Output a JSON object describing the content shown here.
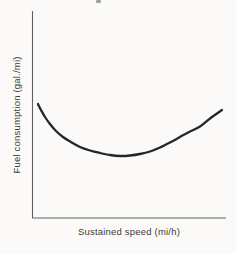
{
  "chart_data": {
    "type": "line",
    "title": "",
    "xlabel": "Sustained speed (mi/h)",
    "ylabel": "Fuel consumption (gal./mi)",
    "x_ticks": [],
    "y_ticks": [],
    "grid": false,
    "legend": false,
    "axes_px": {
      "left": 32,
      "bottom": 218,
      "top": 11,
      "right": 226
    },
    "series": [
      {
        "name": "fuel-consumption-vs-speed",
        "points_px": [
          [
            38,
            104
          ],
          [
            41,
            110
          ],
          [
            45,
            117
          ],
          [
            50,
            124
          ],
          [
            56,
            131
          ],
          [
            63,
            137
          ],
          [
            71,
            142
          ],
          [
            80,
            147
          ],
          [
            90,
            150.5
          ],
          [
            100,
            153
          ],
          [
            110,
            155
          ],
          [
            120,
            156
          ],
          [
            130,
            155.5
          ],
          [
            140,
            154
          ],
          [
            150,
            151.5
          ],
          [
            160,
            147.5
          ],
          [
            170,
            142.5
          ],
          [
            180,
            137
          ],
          [
            190,
            131.5
          ],
          [
            200,
            126.5
          ],
          [
            210,
            118.5
          ],
          [
            217,
            113.5
          ],
          [
            222,
            110
          ]
        ],
        "points_normalized": [
          [
            0.03,
            0.55
          ],
          [
            0.09,
            0.47
          ],
          [
            0.15,
            0.4
          ],
          [
            0.25,
            0.35
          ],
          [
            0.35,
            0.32
          ],
          [
            0.45,
            0.3
          ],
          [
            0.56,
            0.31
          ],
          [
            0.66,
            0.34
          ],
          [
            0.76,
            0.39
          ],
          [
            0.87,
            0.44
          ],
          [
            0.98,
            0.52
          ]
        ]
      }
    ],
    "colors": {
      "curve": "#262626",
      "axis": "#606060",
      "text": "#3b3b3b",
      "background": "#fbfaf8"
    }
  },
  "artifacts": {
    "top_edge_speck": true
  }
}
